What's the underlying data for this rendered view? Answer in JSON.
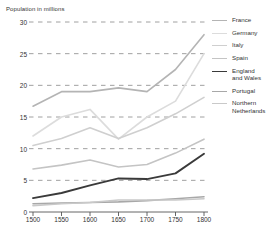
{
  "chart_data": {
    "type": "line",
    "title": "",
    "ylabel": "Population in millions",
    "xlabel": "",
    "x": [
      1500,
      1550,
      1600,
      1650,
      1700,
      1750,
      1800
    ],
    "xtick_labels": [
      "1500",
      "1550",
      "1600",
      "1650",
      "1700",
      "1750",
      "1800"
    ],
    "ytick_labels": [
      "0",
      "5",
      "10",
      "15",
      "20",
      "25",
      "30"
    ],
    "ylim": [
      0,
      30
    ],
    "xlim": [
      1500,
      1800
    ],
    "grid": "horizontal-dashed",
    "legend_position": "right",
    "series": [
      {
        "name": "France",
        "color": "#b4b4b4",
        "width": 1.6,
        "values": [
          16.7,
          19.0,
          19.0,
          19.6,
          19.0,
          22.5,
          28.0
        ]
      },
      {
        "name": "Germany",
        "color": "#dcdcdc",
        "width": 1.6,
        "values": [
          12.0,
          15.0,
          16.2,
          11.5,
          15.0,
          17.5,
          25.0
        ]
      },
      {
        "name": "Italy",
        "color": "#cfcfcf",
        "width": 1.6,
        "values": [
          10.5,
          11.6,
          13.3,
          11.6,
          13.3,
          15.5,
          18.1
        ]
      },
      {
        "name": "Spain",
        "color": "#c4c4c4",
        "width": 1.6,
        "values": [
          6.8,
          7.4,
          8.2,
          7.1,
          7.5,
          9.3,
          11.5
        ]
      },
      {
        "name": "England\nand Wales",
        "color": "#3a3a3a",
        "width": 1.9,
        "values": [
          2.2,
          3.0,
          4.2,
          5.3,
          5.2,
          6.1,
          9.2
        ]
      },
      {
        "name": "Portugal",
        "color": "#a8a8a8",
        "width": 1.6,
        "values": [
          1.3,
          1.4,
          1.5,
          1.6,
          1.8,
          2.1,
          2.4
        ]
      },
      {
        "name": "Northern\nNetherlands",
        "color": "#c9c9c9",
        "width": 1.6,
        "values": [
          1.0,
          1.3,
          1.5,
          1.9,
          1.9,
          1.9,
          2.1
        ]
      }
    ]
  },
  "axis": {
    "title_text": "Population in millions"
  },
  "legend": {
    "entries": [
      {
        "label": "France"
      },
      {
        "label": "Germany"
      },
      {
        "label": "Italy"
      },
      {
        "label": "Spain"
      },
      {
        "label": "England\nand Wales"
      },
      {
        "label": "Portugal"
      },
      {
        "label": "Northern\nNetherlands"
      }
    ]
  },
  "colors": {
    "grid": "#888888",
    "axis": "#555555",
    "text": "#333333",
    "background": "#ffffff"
  }
}
